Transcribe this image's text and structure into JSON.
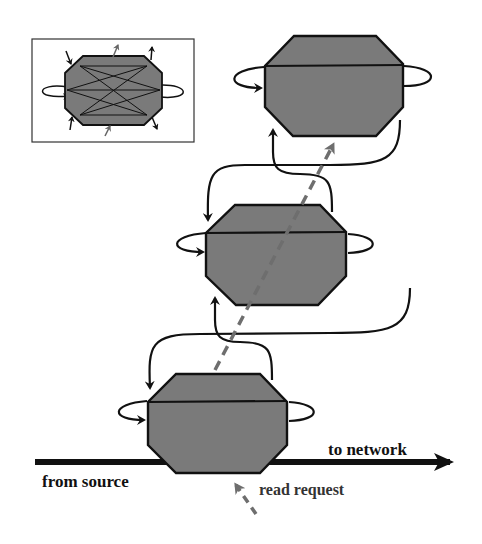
{
  "diagram": {
    "labels": {
      "to_network": "to network",
      "from_source": "from source",
      "read_request": "read request"
    },
    "nodes": [
      {
        "id": "node-top",
        "role": "stacked block"
      },
      {
        "id": "node-middle",
        "role": "stacked block"
      },
      {
        "id": "node-bottom",
        "role": "stacked block"
      }
    ],
    "inset": {
      "description": "single block with internal crossing connections"
    },
    "colors": {
      "block_fill": "#7a7a7a",
      "stroke": "#111111",
      "dashed_arrow": "#6e6e6e",
      "background": "#ffffff"
    }
  }
}
